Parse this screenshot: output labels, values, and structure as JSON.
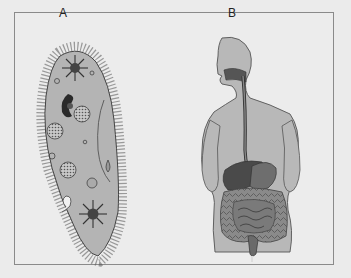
{
  "figure": {
    "panels": [
      {
        "id": "A",
        "label": "A",
        "subject": "paramecium (single-celled organism)"
      },
      {
        "id": "B",
        "label": "B",
        "subject": "human digestive system"
      }
    ],
    "colors": {
      "background": "#ebebeb",
      "frame_border": "#8a8a8a",
      "cell_fill": "#b4b4b4",
      "body_fill": "#b8b8b8",
      "dark_organ": "#3a3a3a",
      "outline": "#444444"
    }
  }
}
